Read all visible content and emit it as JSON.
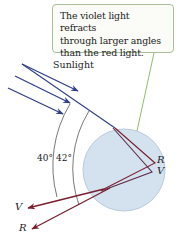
{
  "callout": {
    "lines": [
      "The violet light refracts",
      "through larger angles",
      "than the red light."
    ]
  },
  "labels": {
    "sunlight": "Sunlight",
    "angle_40": "40°",
    "angle_42": "42°",
    "reflect_R": "R",
    "reflect_V": "V",
    "exit_V": "V",
    "exit_R": "R"
  },
  "colors": {
    "sun_ray": "#2f3f86",
    "red_ray": "#7a1f2e",
    "droplet_fill": "#d4e2ef",
    "droplet_stroke": "#b9cbdc",
    "callout_border": "#a9bf99",
    "pointer": "#8fbf6a",
    "arc": "#555555"
  }
}
